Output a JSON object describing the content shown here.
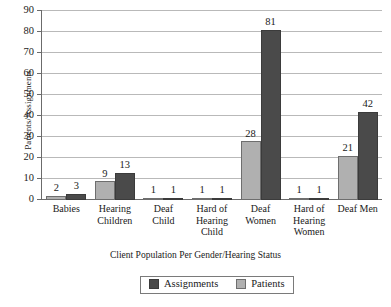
{
  "chart_data": {
    "type": "bar",
    "title": "",
    "xlabel": "Client Population Per Gender/Hearing Status",
    "ylabel": "Patients/Assignments",
    "ylim": [
      0,
      90
    ],
    "ytick_step": 10,
    "yticks": [
      0,
      10,
      20,
      30,
      40,
      50,
      60,
      70,
      80,
      90
    ],
    "grid": true,
    "legend_position": "bottom-center",
    "categories": [
      "Babies",
      "Hearing Children",
      "Deaf Child",
      "Hard of Hearing Child",
      "Deaf Women",
      "Hard of Hearing Women",
      "Deaf Men"
    ],
    "category_lines": [
      [
        "Babies"
      ],
      [
        "Hearing",
        "Children"
      ],
      [
        "Deaf",
        "Child"
      ],
      [
        "Hard of",
        "Hearing",
        "Child"
      ],
      [
        "Deaf",
        "Women"
      ],
      [
        "Hard of",
        "Hearing",
        "Women"
      ],
      [
        "Deaf Men"
      ]
    ],
    "series": [
      {
        "name": "Patients",
        "color": "#b0b0b0",
        "values": [
          2,
          9,
          1,
          1,
          28,
          1,
          21
        ]
      },
      {
        "name": "Assignments",
        "color": "#4a4a4a",
        "values": [
          3,
          13,
          1,
          1,
          81,
          1,
          42
        ]
      }
    ]
  },
  "legend": {
    "items": [
      {
        "label": "Assignments",
        "color": "#4a4a4a"
      },
      {
        "label": "Patients",
        "color": "#b0b0b0"
      }
    ]
  },
  "colors": {
    "assignments": "#4a4a4a",
    "patients": "#b0b0b0",
    "axis": "#6b6b6b",
    "gridline": "#b9b9b9",
    "text": "#1a1a1a",
    "background": "#ffffff"
  }
}
